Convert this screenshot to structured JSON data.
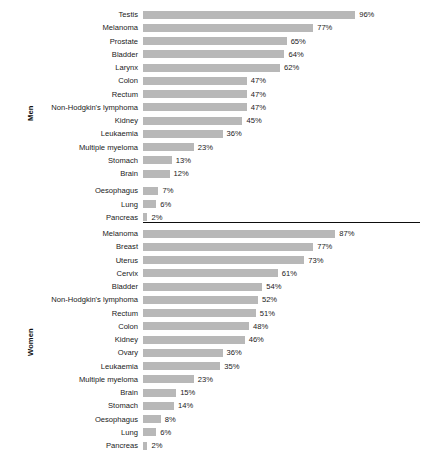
{
  "chart_data": {
    "type": "bar",
    "title": "",
    "subtitle": "",
    "xlabel": "",
    "ylabel": "",
    "orientation": "horizontal",
    "grid": false,
    "legend": null,
    "value_suffix": "%",
    "xlim": [
      0,
      100
    ],
    "panels": [
      {
        "group_label": "Men",
        "categories": [
          "Testis",
          "Melanoma",
          "Prostate",
          "Bladder",
          "Larynx",
          "Colon",
          "Rectum",
          "Non-Hodgkin's lymphoma",
          "Kidney",
          "Leukaemia",
          "Multiple myeloma",
          "Stomach",
          "Brain",
          "Oesophagus",
          "Lung",
          "Pancreas"
        ],
        "values": [
          96,
          77,
          65,
          64,
          62,
          47,
          47,
          47,
          45,
          36,
          23,
          13,
          12,
          7,
          6,
          2
        ],
        "value_labels": [
          "96%",
          "77%",
          "65%",
          "64%",
          "62%",
          "47%",
          "47%",
          "47%",
          "45%",
          "36%",
          "23%",
          "13%",
          "12%",
          "7%",
          "6%",
          "2%"
        ]
      },
      {
        "group_label": "Women",
        "categories": [
          "Melanoma",
          "Breast",
          "Uterus",
          "Cervix",
          "Bladder",
          "Non-Hodgkin's lymphoma",
          "Rectum",
          "Colon",
          "Kidney",
          "Ovary",
          "Leukaemia",
          "Multiple myeloma",
          "Brain",
          "Stomach",
          "Oesophagus",
          "Lung",
          "Pancreas"
        ],
        "values": [
          87,
          77,
          73,
          61,
          54,
          52,
          51,
          48,
          46,
          36,
          35,
          23,
          15,
          14,
          8,
          6,
          2
        ],
        "value_labels": [
          "87%",
          "77%",
          "73%",
          "61%",
          "54%",
          "52%",
          "51%",
          "48%",
          "46%",
          "36%",
          "35%",
          "23%",
          "15%",
          "14%",
          "8%",
          "6%",
          "2%"
        ]
      }
    ],
    "colors": {
      "bar": "#b8b8b8",
      "text": "#1a1a1a",
      "divider": "#0d0d0d",
      "background": "#ffffff"
    }
  }
}
